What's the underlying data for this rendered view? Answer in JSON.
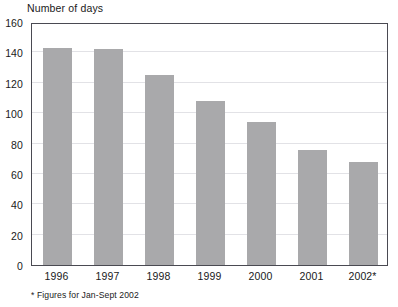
{
  "chart_data": {
    "type": "bar",
    "title": "Number of days",
    "xlabel": "",
    "ylabel": "Number of days",
    "categories": [
      "1996",
      "1997",
      "1998",
      "1999",
      "2000",
      "2001",
      "2002*"
    ],
    "values": [
      143,
      142,
      125,
      108,
      94,
      76,
      68
    ],
    "ylim": [
      0,
      160
    ],
    "ytick_labels": [
      "160",
      "140",
      "120",
      "100",
      "80",
      "60",
      "40",
      "20",
      "0"
    ],
    "yticks": [
      160,
      140,
      120,
      100,
      80,
      60,
      40,
      20,
      0
    ],
    "grid": true,
    "legend": false,
    "bar_color": "#a9a9ab",
    "frame_color": "#4a4a52",
    "gridline_color": "#e2e2e6",
    "footnote": "* Figures for Jan-Sept 2002"
  }
}
